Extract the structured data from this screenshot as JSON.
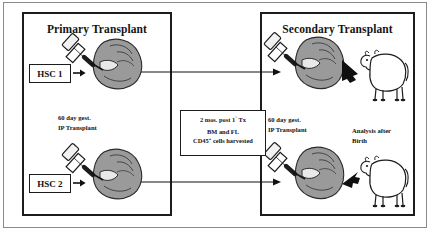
{
  "figure": {
    "background_color": "#ffffff",
    "ink_color": "#1c1c1c",
    "fetus_fill_color": "#9a9a9a",
    "sheep_fill_color": "#ffffff"
  },
  "panels": {
    "primary": {
      "title": "Primary Transplant",
      "gestation_label_line1": "60 day gest.",
      "gestation_label_line2": "IP Transplant",
      "sources": [
        {
          "label": "HSC 1"
        },
        {
          "label": "HSC 2"
        }
      ]
    },
    "secondary": {
      "title": "Secondary Transplant",
      "gestation_label_line1": "60 day gest.",
      "gestation_label_line2": "IP Transplant",
      "analysis_label_line1": "Analysis after",
      "analysis_label_line2": "Birth"
    }
  },
  "info_box": {
    "line1_prefix": "2 mos. post 1",
    "line1_sup": "°",
    "line1_suffix": " Tx",
    "line2": "BM and FL",
    "line3_prefix": "CD45",
    "line3_sup": "+",
    "line3_suffix": " cells harvested"
  },
  "icons": {
    "hsc_arrow": "arrow-right-icon",
    "transfer_arrow": "long-arrow-right-icon",
    "birth_arrow": "thick-arrow-right-icon",
    "syringe": "syringe-icon",
    "fetus": "fetus-icon",
    "sheep": "sheep-icon"
  }
}
